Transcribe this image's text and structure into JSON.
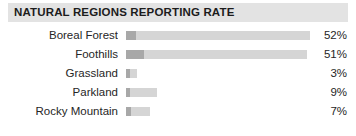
{
  "header": {
    "title": "NATURAL REGIONS REPORTING RATE",
    "band_color": "#e3e3e3",
    "text_color": "#1c1c1c"
  },
  "chart_data": {
    "type": "bar",
    "title": "NATURAL REGIONS REPORTING RATE",
    "orientation": "horizontal",
    "xlabel": "",
    "ylabel": "",
    "grid": false,
    "legend": "none",
    "xlim": [
      0,
      52
    ],
    "axis_visible": false,
    "value_label_suffix": "%",
    "bar_color": "#d5d5d5",
    "bar_cap_color": "#a8a8a8",
    "categories": [
      "Boreal Forest",
      "Foothills",
      "Grassland",
      "Parkland",
      "Rocky Mountain"
    ],
    "values": [
      52,
      51,
      3,
      9,
      7
    ],
    "value_labels": [
      "52%",
      "51%",
      "3%",
      "9%",
      "7%"
    ]
  },
  "rows": [
    {
      "label": "Boreal Forest",
      "value": 52,
      "value_label": "52%",
      "bar_px": 184,
      "cap_px": 10
    },
    {
      "label": "Foothills",
      "value": 51,
      "value_label": "51%",
      "bar_px": 181,
      "cap_px": 18
    },
    {
      "label": "Grassland",
      "value": 3,
      "value_label": "3%",
      "bar_px": 11,
      "cap_px": 4
    },
    {
      "label": "Parkland",
      "value": 9,
      "value_label": "9%",
      "bar_px": 31,
      "cap_px": 4
    },
    {
      "label": "Rocky Mountain",
      "value": 7,
      "value_label": "7%",
      "bar_px": 24,
      "cap_px": 5
    }
  ]
}
